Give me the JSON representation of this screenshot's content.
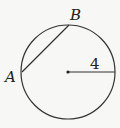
{
  "diagram": {
    "type": "circle-geometry",
    "circle": {
      "cx": 68,
      "cy": 72,
      "r": 47,
      "stroke": "#333333"
    },
    "center_dot": {
      "x": 68,
      "y": 72
    },
    "radius_segment": {
      "x1": 68,
      "y1": 72,
      "x2": 115,
      "y2": 72,
      "label": "4"
    },
    "chord": {
      "from": "A",
      "to": "B",
      "x1": 22,
      "y1": 72,
      "x2": 69,
      "y2": 25
    },
    "points": [
      {
        "name": "A",
        "label": "A",
        "lx": 5,
        "ly": 82
      },
      {
        "name": "B",
        "label": "B",
        "lx": 70,
        "ly": 20
      }
    ],
    "radius_label_pos": {
      "x": 90,
      "y": 69
    }
  }
}
